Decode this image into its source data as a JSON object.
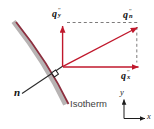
{
  "figure": {
    "isotherm_label": "Isotherm",
    "normal_label": "n",
    "axis_labels": {
      "x": "x",
      "y": "y"
    },
    "flux_vectors": {
      "qy": {
        "base": "q",
        "sub": "y",
        "prime": "″"
      },
      "qn": {
        "base": "q",
        "sub": "n",
        "prime": "″"
      },
      "qx": {
        "base": "q",
        "sub": "x",
        "prime": "″"
      }
    },
    "colors": {
      "vector_red": "#c0182c",
      "isotherm_line": "#8d2f3f",
      "isotherm_shadow": "#b7b3b3",
      "dash_gray": "#7d7b7b",
      "axis_black": "#1c1c1c",
      "text_dark": "#3e3e3e"
    }
  }
}
